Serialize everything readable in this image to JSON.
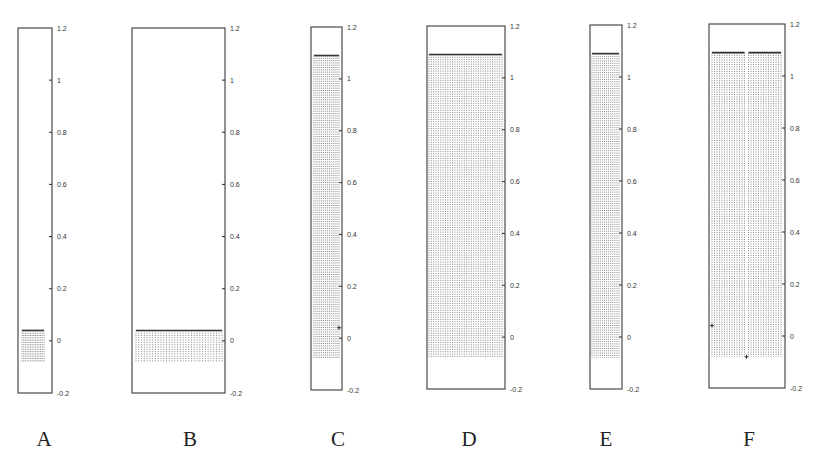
{
  "chart_data": [
    {
      "id": "A",
      "type": "bar",
      "label": "A",
      "ylim": [
        -0.2,
        1.2
      ],
      "yticks": [
        "1.2",
        "1",
        "0.8",
        "0.6",
        "0.4",
        "0.2",
        "0",
        "-0.2"
      ],
      "ytick_values": [
        1.2,
        1.0,
        0.8,
        0.6,
        0.4,
        0.2,
        0.0,
        -0.2
      ],
      "series": [
        {
          "name": "stems",
          "n": 14,
          "top": 0.04,
          "bottom": -0.08
        }
      ],
      "markers": []
    },
    {
      "id": "B",
      "type": "bar",
      "label": "B",
      "ylim": [
        -0.2,
        1.2
      ],
      "yticks": [
        "1.2",
        "1",
        "0.8",
        "0.6",
        "0.4",
        "0.2",
        "0",
        "-0.2"
      ],
      "ytick_values": [
        1.2,
        1.0,
        0.8,
        0.6,
        0.4,
        0.2,
        0.0,
        -0.2
      ],
      "series": [
        {
          "name": "stems",
          "n": 32,
          "top": 0.04,
          "bottom": -0.08
        }
      ],
      "markers": []
    },
    {
      "id": "C",
      "type": "bar",
      "label": "C",
      "ylim": [
        -0.2,
        1.2
      ],
      "yticks": [
        "1.2",
        "1",
        "0.8",
        "0.6",
        "0.4",
        "0.2",
        "0",
        "-0.2"
      ],
      "ytick_values": [
        1.2,
        1.0,
        0.8,
        0.6,
        0.4,
        0.2,
        0.0,
        -0.2
      ],
      "series": [
        {
          "name": "stems",
          "n": 14,
          "top": 1.09,
          "bottom": -0.08
        }
      ],
      "markers": [
        {
          "series_frac": 1.0,
          "y": 0.04
        }
      ]
    },
    {
      "id": "D",
      "type": "bar",
      "label": "D",
      "ylim": [
        -0.2,
        1.2
      ],
      "yticks": [
        "1.2",
        "1",
        "0.8",
        "0.6",
        "0.4",
        "0.2",
        "0",
        "-0.2"
      ],
      "ytick_values": [
        1.2,
        1.0,
        0.8,
        0.6,
        0.4,
        0.2,
        0.0,
        -0.2
      ],
      "series": [
        {
          "name": "stems",
          "n": 32,
          "top": 1.09,
          "bottom": -0.08
        }
      ],
      "markers": []
    },
    {
      "id": "E",
      "type": "bar",
      "label": "E",
      "ylim": [
        -0.2,
        1.2
      ],
      "yticks": [
        "1.2",
        "1",
        "0.8",
        "0.6",
        "0.4",
        "0.2",
        "0",
        "-0.2"
      ],
      "ytick_values": [
        1.2,
        1.0,
        0.8,
        0.6,
        0.4,
        0.2,
        0.0,
        -0.2
      ],
      "series": [
        {
          "name": "stems",
          "n": 14,
          "top": 1.09,
          "bottom": -0.08
        }
      ],
      "markers": []
    },
    {
      "id": "F",
      "type": "bar",
      "label": "F",
      "ylim": [
        -0.2,
        1.2
      ],
      "yticks": [
        "1.2",
        "1",
        "0.8",
        "0.6",
        "0.4",
        "0.2",
        "0",
        "-0.2"
      ],
      "ytick_values": [
        1.2,
        1.0,
        0.8,
        0.6,
        0.4,
        0.2,
        0.0,
        -0.2
      ],
      "series": [
        {
          "name": "stems-left",
          "n": 14,
          "top": 1.09,
          "bottom": -0.08
        },
        {
          "name": "stems-right",
          "n": 14,
          "top": 1.09,
          "bottom": -0.08
        }
      ],
      "markers": [
        {
          "series_frac": 0.0,
          "y": 0.04
        },
        {
          "series_frac": 0.5,
          "y": -0.08
        }
      ]
    }
  ]
}
